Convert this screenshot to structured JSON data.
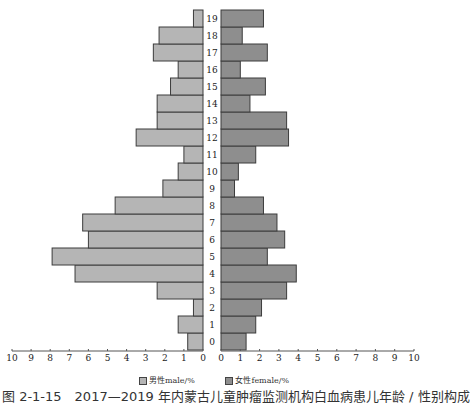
{
  "chart_data": {
    "type": "bar",
    "orientation": "horizontal-pyramid",
    "title": "",
    "categories": [
      "0",
      "1",
      "2",
      "3",
      "4",
      "5",
      "6",
      "7",
      "8",
      "9",
      "10",
      "11",
      "12",
      "13",
      "14",
      "15",
      "16",
      "17",
      "18",
      "19"
    ],
    "series": [
      {
        "name": "男性male/%",
        "color": "#b5b5b5",
        "side": "left",
        "values": [
          0.8,
          1.3,
          0.5,
          2.4,
          6.7,
          7.9,
          6.0,
          6.3,
          4.6,
          2.1,
          1.3,
          1.0,
          3.5,
          2.4,
          2.4,
          1.7,
          1.3,
          2.6,
          2.3,
          0.5
        ]
      },
      {
        "name": "女性female/%",
        "color": "#8e8e8e",
        "side": "right",
        "values": [
          1.3,
          1.8,
          2.1,
          3.4,
          3.9,
          2.4,
          3.3,
          2.9,
          2.2,
          0.7,
          0.9,
          1.8,
          3.5,
          3.4,
          1.5,
          2.3,
          1.0,
          2.4,
          1.1,
          2.2
        ]
      }
    ],
    "xlabel": "",
    "ylabel": "",
    "x_ticks_left": [
      "10",
      "9",
      "8",
      "7",
      "6",
      "5",
      "4",
      "3",
      "2",
      "1",
      "0"
    ],
    "x_ticks_right": [
      "0",
      "1",
      "2",
      "3",
      "4",
      "5",
      "6",
      "7",
      "8",
      "9",
      "10"
    ],
    "xlim": [
      0,
      10
    ],
    "grid": false,
    "legend_position": "bottom"
  },
  "legend": {
    "male": "男性male/%",
    "female": "女性female/%"
  },
  "caption": "图 2-1-15　2017—2019 年内蒙古儿童肿瘤监测机构白血病患儿年龄 / 性别构成"
}
